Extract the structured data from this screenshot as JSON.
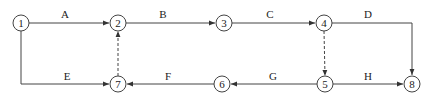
{
  "diagram": {
    "type": "activity-network",
    "nodes": [
      {
        "id": "1",
        "label": "1",
        "x": 21,
        "y": 23
      },
      {
        "id": "2",
        "label": "2",
        "x": 118,
        "y": 23
      },
      {
        "id": "3",
        "label": "3",
        "x": 224,
        "y": 23
      },
      {
        "id": "4",
        "label": "4",
        "x": 324,
        "y": 23
      },
      {
        "id": "5",
        "label": "5",
        "x": 325,
        "y": 84
      },
      {
        "id": "6",
        "label": "6",
        "x": 222,
        "y": 84
      },
      {
        "id": "7",
        "label": "7",
        "x": 118,
        "y": 84
      },
      {
        "id": "8",
        "label": "8",
        "x": 412,
        "y": 84
      }
    ],
    "edges": [
      {
        "label": "A",
        "from": "1",
        "to": "2",
        "style": "solid"
      },
      {
        "label": "B",
        "from": "2",
        "to": "3",
        "style": "solid"
      },
      {
        "label": "C",
        "from": "3",
        "to": "4",
        "style": "solid"
      },
      {
        "label": "D",
        "from": "4",
        "to": "8",
        "style": "solid",
        "route": "right-then-down"
      },
      {
        "label": "E",
        "from": "1",
        "to": "7",
        "style": "solid",
        "route": "down-then-right"
      },
      {
        "label": "F",
        "from": "6",
        "to": "7",
        "style": "solid"
      },
      {
        "label": "G",
        "from": "5",
        "to": "6",
        "style": "solid"
      },
      {
        "label": "H",
        "from": "5",
        "to": "8",
        "style": "solid"
      },
      {
        "label": "",
        "from": "7",
        "to": "2",
        "style": "dashed"
      },
      {
        "label": "",
        "from": "4",
        "to": "5",
        "style": "dashed"
      }
    ]
  }
}
